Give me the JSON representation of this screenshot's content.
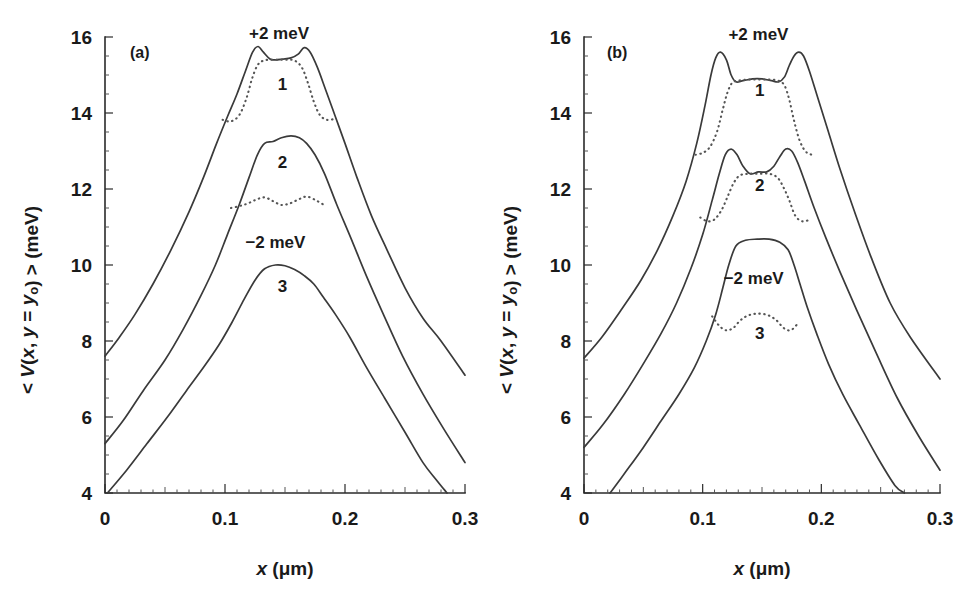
{
  "figure": {
    "background": "#ffffff",
    "curve_color": "#3a3a3a",
    "dotted_color": "#555555",
    "axis_color": "#2b2b2b",
    "width": 977,
    "height": 599
  },
  "axes": {
    "ylabel_parts": {
      "lt": "< ",
      "v": "V",
      "mid": "(x, y = y",
      "sub": "o",
      "close": ") > (meV)"
    },
    "ylabel_text": "< V(x, y = yₒ) > (meV)",
    "xlabel_parts": {
      "x": "x",
      "units": " (μm)"
    },
    "xlabel_text": "x (μm)",
    "ytick_labels": [
      "4",
      "6",
      "8",
      "10",
      "12",
      "14",
      "16"
    ],
    "ytick_values": [
      4,
      6,
      8,
      10,
      12,
      14,
      16
    ],
    "xtick_labels": [
      "0",
      "0.1",
      "0.2",
      "0.3"
    ],
    "xtick_values": [
      0,
      0.1,
      0.2,
      0.3
    ],
    "ylim": [
      4,
      16
    ],
    "xlim": [
      0,
      0.3
    ],
    "y_minor_step": 0.5,
    "x_minor_step": 0.01
  },
  "panels": [
    {
      "id": "a",
      "tag": "(a)"
    },
    {
      "id": "b",
      "tag": "(b)"
    }
  ],
  "annotations": {
    "plus_two": "+2 meV",
    "minus_two": "−2 meV",
    "curve_1": "1",
    "curve_2": "2",
    "curve_3": "3"
  },
  "chart_data": {
    "type": "line",
    "title": "",
    "xlabel": "x (μm)",
    "ylabel": "< V(x, y = yₒ) > (meV)",
    "xlim": [
      0,
      0.3
    ],
    "ylim": [
      4,
      16
    ],
    "grid": false,
    "legend": "none",
    "panels": [
      {
        "panel": "a",
        "tag": "(a)",
        "annotations": [
          {
            "text": "+2 meV",
            "x": 0.145,
            "y": 15.95
          },
          {
            "text": "1",
            "x": 0.148,
            "y": 14.6
          },
          {
            "text": "2",
            "x": 0.148,
            "y": 12.55
          },
          {
            "text": "−2 meV",
            "x": 0.142,
            "y": 10.45
          },
          {
            "text": "3",
            "x": 0.148,
            "y": 9.3
          }
        ],
        "series": [
          {
            "name": "1",
            "label": "+2 meV",
            "style": "solid",
            "x": [
              0.0,
              0.012,
              0.025,
              0.04,
              0.055,
              0.07,
              0.082,
              0.093,
              0.102,
              0.11,
              0.117,
              0.123,
              0.1275,
              0.132,
              0.1375,
              0.142,
              0.148,
              0.155,
              0.161,
              0.166,
              0.171,
              0.177,
              0.184,
              0.192,
              0.2,
              0.21,
              0.222,
              0.235,
              0.25,
              0.265,
              0.28,
              0.3
            ],
            "y": [
              7.6,
              8.1,
              8.7,
              9.5,
              10.4,
              11.4,
              12.3,
              13.2,
              13.9,
              14.5,
              15.1,
              15.6,
              15.75,
              15.6,
              15.42,
              15.4,
              15.42,
              15.45,
              15.55,
              15.72,
              15.6,
              15.2,
              14.6,
              13.9,
              13.2,
              12.3,
              11.3,
              10.4,
              9.4,
              8.6,
              8.0,
              7.1
            ]
          },
          {
            "name": "1-dotted",
            "label": "",
            "style": "dotted",
            "x": [
              0.098,
              0.105,
              0.112,
              0.118,
              0.1225,
              0.127,
              0.132,
              0.138,
              0.145,
              0.152,
              0.158,
              0.164,
              0.169,
              0.174,
              0.179,
              0.185,
              0.192
            ],
            "y": [
              13.82,
              13.78,
              13.95,
              14.4,
              14.9,
              15.25,
              15.38,
              15.4,
              15.4,
              15.4,
              15.38,
              15.2,
              14.8,
              14.3,
              13.95,
              13.82,
              13.85
            ]
          },
          {
            "name": "2",
            "label": "",
            "style": "solid",
            "x": [
              0.0,
              0.015,
              0.032,
              0.05,
              0.065,
              0.08,
              0.092,
              0.102,
              0.112,
              0.12,
              0.127,
              0.133,
              0.14,
              0.147,
              0.155,
              0.162,
              0.168,
              0.175,
              0.183,
              0.193,
              0.205,
              0.218,
              0.232,
              0.248,
              0.265,
              0.282,
              0.3
            ],
            "y": [
              5.3,
              5.9,
              6.7,
              7.5,
              8.3,
              9.2,
              10.0,
              10.8,
              11.6,
              12.3,
              12.9,
              13.2,
              13.25,
              13.35,
              13.4,
              13.35,
              13.2,
              12.9,
              12.4,
              11.6,
              10.7,
              9.7,
              8.7,
              7.6,
              6.6,
              5.7,
              4.8
            ]
          },
          {
            "name": "2-dotted",
            "label": "",
            "style": "dotted",
            "x": [
              0.105,
              0.112,
              0.119,
              0.126,
              0.133,
              0.14,
              0.147,
              0.154,
              0.161,
              0.168,
              0.176,
              0.184
            ],
            "y": [
              11.5,
              11.55,
              11.62,
              11.72,
              11.78,
              11.68,
              11.58,
              11.62,
              11.72,
              11.8,
              11.7,
              11.55
            ]
          },
          {
            "name": "3",
            "label": "−2 meV",
            "style": "solid",
            "x": [
              0.002,
              0.018,
              0.035,
              0.052,
              0.068,
              0.082,
              0.095,
              0.106,
              0.116,
              0.125,
              0.133,
              0.142,
              0.15,
              0.158,
              0.166,
              0.174,
              0.182,
              0.192,
              0.204,
              0.218,
              0.233,
              0.25,
              0.265,
              0.276,
              0.285
            ],
            "y": [
              4.0,
              4.6,
              5.3,
              6.0,
              6.7,
              7.3,
              7.9,
              8.5,
              9.1,
              9.6,
              9.9,
              10.0,
              9.98,
              9.88,
              9.72,
              9.5,
              9.15,
              8.7,
              8.1,
              7.3,
              6.5,
              5.6,
              4.8,
              4.35,
              4.0
            ]
          }
        ]
      },
      {
        "panel": "b",
        "tag": "(b)",
        "annotations": [
          {
            "text": "+2 meV",
            "x": 0.147,
            "y": 15.92
          },
          {
            "text": "1",
            "x": 0.148,
            "y": 14.45
          },
          {
            "text": "2",
            "x": 0.148,
            "y": 11.95
          },
          {
            "text": "−2 meV",
            "x": 0.143,
            "y": 9.5
          },
          {
            "text": "3",
            "x": 0.148,
            "y": 8.05
          }
        ],
        "series": [
          {
            "name": "1",
            "label": "+2 meV",
            "style": "solid",
            "x": [
              0.0,
              0.015,
              0.032,
              0.048,
              0.062,
              0.075,
              0.086,
              0.095,
              0.102,
              0.107,
              0.111,
              0.115,
              0.12,
              0.124,
              0.128,
              0.134,
              0.142,
              0.15,
              0.158,
              0.164,
              0.169,
              0.173,
              0.177,
              0.181,
              0.185,
              0.19,
              0.197,
              0.206,
              0.216,
              0.228,
              0.242,
              0.258,
              0.275,
              0.3
            ],
            "y": [
              7.55,
              8.1,
              8.85,
              9.6,
              10.4,
              11.3,
              12.2,
              13.2,
              14.2,
              15.0,
              15.45,
              15.6,
              15.4,
              15.0,
              14.82,
              14.85,
              14.9,
              14.9,
              14.85,
              14.82,
              14.95,
              15.25,
              15.5,
              15.6,
              15.5,
              15.1,
              14.4,
              13.5,
              12.5,
              11.4,
              10.2,
              9.0,
              8.1,
              7.0
            ]
          },
          {
            "name": "1-dotted",
            "label": "",
            "style": "dotted",
            "x": [
              0.094,
              0.1,
              0.106,
              0.112,
              0.117,
              0.121,
              0.125,
              0.13,
              0.138,
              0.147,
              0.156,
              0.164,
              0.169,
              0.173,
              0.177,
              0.182,
              0.188,
              0.195
            ],
            "y": [
              12.9,
              12.95,
              13.1,
              13.5,
              14.1,
              14.55,
              14.8,
              14.85,
              14.88,
              14.88,
              14.88,
              14.85,
              14.72,
              14.35,
              13.8,
              13.25,
              12.95,
              12.9
            ]
          },
          {
            "name": "2",
            "label": "",
            "style": "solid",
            "x": [
              0.0,
              0.016,
              0.034,
              0.05,
              0.065,
              0.078,
              0.09,
              0.1,
              0.108,
              0.114,
              0.119,
              0.124,
              0.129,
              0.134,
              0.14,
              0.147,
              0.154,
              0.16,
              0.165,
              0.17,
              0.175,
              0.18,
              0.186,
              0.194,
              0.204,
              0.216,
              0.23,
              0.246,
              0.264,
              0.282,
              0.3
            ],
            "y": [
              5.2,
              5.8,
              6.6,
              7.4,
              8.2,
              9.0,
              9.9,
              10.8,
              11.7,
              12.4,
              12.9,
              13.05,
              12.9,
              12.6,
              12.4,
              12.45,
              12.45,
              12.6,
              12.85,
              13.05,
              13.0,
              12.7,
              12.2,
              11.5,
              10.7,
              9.8,
              8.8,
              7.7,
              6.5,
              5.5,
              4.6
            ]
          },
          {
            "name": "2-dotted",
            "label": "",
            "style": "dotted",
            "x": [
              0.098,
              0.104,
              0.11,
              0.116,
              0.121,
              0.126,
              0.131,
              0.138,
              0.147,
              0.156,
              0.163,
              0.168,
              0.173,
              0.178,
              0.184,
              0.191
            ],
            "y": [
              11.25,
              11.15,
              11.2,
              11.45,
              11.8,
              12.15,
              12.35,
              12.4,
              12.4,
              12.4,
              12.3,
              12.05,
              11.7,
              11.3,
              11.15,
              11.2
            ]
          },
          {
            "name": "3",
            "label": "−2 meV",
            "style": "solid",
            "x": [
              0.022,
              0.035,
              0.05,
              0.065,
              0.08,
              0.093,
              0.103,
              0.111,
              0.117,
              0.122,
              0.128,
              0.136,
              0.146,
              0.156,
              0.165,
              0.172,
              0.177,
              0.182,
              0.188,
              0.196,
              0.206,
              0.218,
              0.232,
              0.248,
              0.262,
              0.27
            ],
            "y": [
              4.0,
              4.55,
              5.2,
              5.9,
              6.6,
              7.3,
              8.0,
              8.7,
              9.4,
              10.0,
              10.5,
              10.65,
              10.68,
              10.68,
              10.6,
              10.4,
              10.0,
              9.5,
              8.9,
              8.2,
              7.4,
              6.6,
              5.8,
              4.9,
              4.2,
              4.0
            ]
          },
          {
            "name": "3-dotted",
            "label": "",
            "style": "dotted",
            "x": [
              0.108,
              0.114,
              0.12,
              0.126,
              0.132,
              0.139,
              0.147,
              0.155,
              0.162,
              0.168,
              0.174,
              0.18
            ],
            "y": [
              8.65,
              8.4,
              8.28,
              8.35,
              8.55,
              8.68,
              8.72,
              8.68,
              8.55,
              8.35,
              8.28,
              8.45
            ]
          }
        ]
      }
    ]
  }
}
